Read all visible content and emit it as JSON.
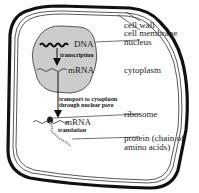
{
  "diagram": {
    "labels": {
      "cell_wall": "cell wall",
      "cell_membrane": "cell membrane",
      "nucleus": "nucleus",
      "cytoplasm": "cytoplasm",
      "ribosome": "ribosome",
      "protein_line1": "protein (chain of",
      "protein_line2": "amino acids)",
      "dna": "DNA",
      "mrna_nucleus": "mRNA",
      "mrna_cytoplasm": "mRNA",
      "transcription": "transcription",
      "transport_line1": "transport to cytoplasm",
      "transport_line2": "through nuclear pore",
      "translation": "translation"
    },
    "colors": {
      "nucleus_fill": "#cccccc",
      "outline": "#111111",
      "background": "#ffffff",
      "protein_chain": "#999999"
    }
  }
}
